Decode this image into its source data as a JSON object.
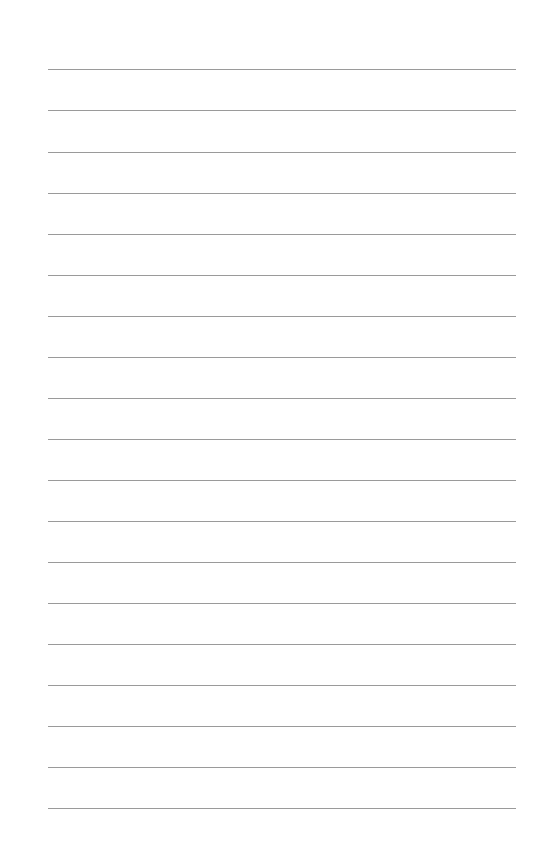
{
  "page": {
    "type": "lined-paper",
    "background": "#ffffff",
    "line_color": "#9a9a9a",
    "line_count": 19,
    "line_left": 48,
    "line_right": 516,
    "line_positions_y": [
      69,
      110,
      152,
      193,
      234,
      275,
      316,
      357,
      398,
      439,
      480,
      521,
      562,
      603,
      644,
      685,
      726,
      767,
      808
    ]
  }
}
